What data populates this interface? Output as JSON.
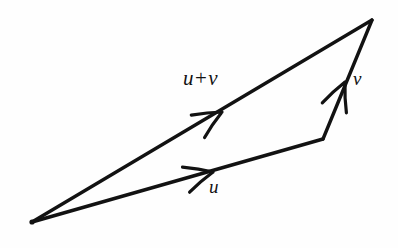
{
  "figure": {
    "background_color": "#fefefe",
    "stroke_color": "#121212",
    "width": 398,
    "height": 248
  },
  "labels": {
    "sum_first": "u",
    "sum_operator": "+",
    "sum_second": "v",
    "u": "u",
    "v": "v"
  },
  "chart_data": {
    "type": "diagram",
    "xlabel": "",
    "ylabel": "",
    "xlim": [
      0,
      398
    ],
    "ylim": [
      248,
      0
    ],
    "grid": false,
    "legend": "none",
    "annotations": [
      "u + v",
      "u",
      "v"
    ],
    "points": [
      {
        "name": "origin",
        "x": 32,
        "y": 222
      },
      {
        "name": "u-terminus",
        "x": 323,
        "y": 139
      },
      {
        "name": "apex",
        "x": 372,
        "y": 20
      }
    ],
    "vectors": [
      {
        "name": "u",
        "label": "u",
        "from": [
          32,
          222
        ],
        "to": [
          323,
          139
        ],
        "arrowhead_at": [
          213,
          172
        ],
        "label_position": [
          209,
          177
        ]
      },
      {
        "name": "v",
        "label": "v",
        "from": [
          323,
          139
        ],
        "to": [
          372,
          20
        ],
        "arrowhead_at": [
          345,
          82
        ],
        "label_position": [
          353,
          69
        ]
      },
      {
        "name": "u+v",
        "label": "u + v",
        "from": [
          32,
          222
        ],
        "to": [
          372,
          20
        ],
        "arrowhead_at": [
          222,
          112
        ],
        "label_position": [
          183,
          68
        ]
      }
    ]
  }
}
